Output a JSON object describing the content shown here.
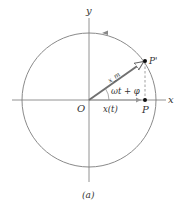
{
  "figure": {
    "caption": "(a)",
    "axes": {
      "x_label": "x",
      "y_label": "y"
    },
    "labels": {
      "origin": "O",
      "point_p": "P",
      "point_p_prime": "P'",
      "vector": "x_m",
      "angle": "ωt + φ",
      "projection": "x(t)"
    },
    "colors": {
      "circle": "#888888",
      "axes": "#777777",
      "vector": "#666666",
      "text": "#333333"
    }
  }
}
